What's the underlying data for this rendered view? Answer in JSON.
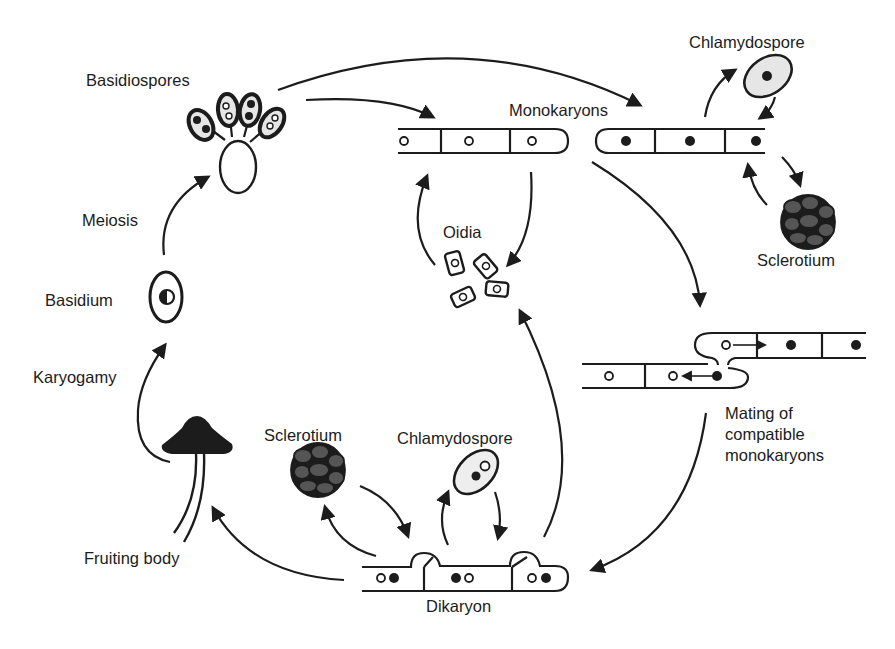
{
  "diagram": {
    "colors": {
      "ink": "#1c1c1c",
      "spore_fill": "#e6e6e6",
      "sclerotium_fill": "#555555",
      "background": "#ffffff"
    },
    "labels": {
      "basidiospores": "Basidiospores",
      "monokaryons": "Monokaryons",
      "chlamydospore_top": "Chlamydospore",
      "sclerotium_top": "Sclerotium",
      "oidia": "Oidia",
      "meiosis": "Meiosis",
      "basidium": "Basidium",
      "karyogamy": "Karyogamy",
      "mating": "Mating of compatible monokaryons",
      "sclerotium_bottom": "Sclerotium",
      "chlamydospore_bottom": "Chlamydospore",
      "fruiting_body": "Fruiting body",
      "dikaryon": "Dikaryon"
    },
    "nodes": [
      {
        "id": "basidiospores",
        "label": "Basidiospores"
      },
      {
        "id": "monokaryon-a",
        "label": "Monokaryons",
        "nuclei": "open"
      },
      {
        "id": "monokaryon-b",
        "label": "Monokaryons",
        "nuclei": "filled"
      },
      {
        "id": "chlamydospore-mono",
        "label": "Chlamydospore"
      },
      {
        "id": "sclerotium-mono",
        "label": "Sclerotium"
      },
      {
        "id": "oidia",
        "label": "Oidia"
      },
      {
        "id": "mating",
        "label": "Mating of compatible monokaryons"
      },
      {
        "id": "dikaryon",
        "label": "Dikaryon"
      },
      {
        "id": "sclerotium-di",
        "label": "Sclerotium"
      },
      {
        "id": "chlamydospore-di",
        "label": "Chlamydospore"
      },
      {
        "id": "fruiting-body",
        "label": "Fruiting body"
      },
      {
        "id": "basidium",
        "label": "Basidium"
      }
    ],
    "edges": [
      {
        "from": "basidiospores",
        "to": "monokaryon-a"
      },
      {
        "from": "basidiospores",
        "to": "monokaryon-b"
      },
      {
        "from": "monokaryon-a",
        "to": "oidia"
      },
      {
        "from": "oidia",
        "to": "monokaryon-a"
      },
      {
        "from": "monokaryon-b",
        "to": "chlamydospore-mono"
      },
      {
        "from": "chlamydospore-mono",
        "to": "monokaryon-b"
      },
      {
        "from": "monokaryon-b",
        "to": "sclerotium-mono"
      },
      {
        "from": "sclerotium-mono",
        "to": "monokaryon-b"
      },
      {
        "from": "monokaryons",
        "to": "mating"
      },
      {
        "from": "mating",
        "to": "dikaryon"
      },
      {
        "from": "dikaryon",
        "to": "oidia"
      },
      {
        "from": "dikaryon",
        "to": "sclerotium-di"
      },
      {
        "from": "sclerotium-di",
        "to": "dikaryon"
      },
      {
        "from": "dikaryon",
        "to": "chlamydospore-di"
      },
      {
        "from": "chlamydospore-di",
        "to": "dikaryon"
      },
      {
        "from": "dikaryon",
        "to": "fruiting-body"
      },
      {
        "from": "fruiting-body",
        "to": "basidium",
        "label": "Karyogamy"
      },
      {
        "from": "basidium",
        "to": "basidiospores",
        "label": "Meiosis"
      }
    ]
  }
}
